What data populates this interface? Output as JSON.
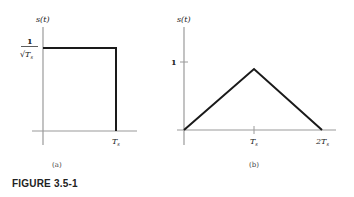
{
  "figure_label": "FIGURE 3.5-1",
  "panels": [
    {
      "id": "a",
      "caption": "(a)",
      "y_label": "s(t)",
      "y_tick_label_numerator": "1",
      "y_tick_label_denominator": "√T",
      "y_tick_label_sub": "s",
      "x_tick_label": "T",
      "x_tick_label_sub": "s",
      "shape": "rectangular pulse",
      "points": [
        [
          0,
          1
        ],
        [
          1,
          1
        ],
        [
          1,
          0
        ]
      ]
    },
    {
      "id": "b",
      "caption": "(b)",
      "y_label": "s(t)",
      "y_tick_label": "1",
      "x_tick_labels": [
        {
          "main": "T",
          "sub": "s"
        },
        {
          "main": "2T",
          "sub": "s"
        }
      ],
      "shape": "triangular pulse",
      "points": [
        [
          0,
          0
        ],
        [
          1,
          0.85
        ],
        [
          2,
          0
        ]
      ]
    }
  ],
  "colors": {
    "axis": "#9a9a9a",
    "signal": "#1a1a1a",
    "text": "#222222"
  }
}
